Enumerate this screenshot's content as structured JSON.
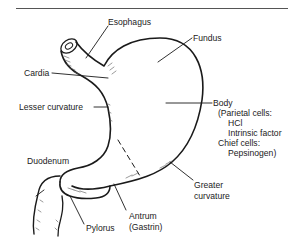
{
  "diagram": {
    "title": "",
    "labels": {
      "esophagus": "Esophagus",
      "fundus": "Fundus",
      "cardia": "Cardia",
      "lesser_curvature": "Lesser curvature",
      "body": "Body",
      "body_detail_1": "(Parietal cells:",
      "body_detail_2": "HCl",
      "body_detail_3": "Intrinsic factor",
      "body_detail_4": "Chief cells:",
      "body_detail_5": "Pepsinogen)",
      "duodenum": "Duodenum",
      "pylorus": "Pylorus",
      "antrum": "Antrum",
      "antrum_detail": "(Gastrin)",
      "greater_curvature_1": "Greater",
      "greater_curvature_2": "curvature"
    },
    "colors": {
      "line": "#1a1a1a",
      "background": "#ffffff"
    }
  }
}
